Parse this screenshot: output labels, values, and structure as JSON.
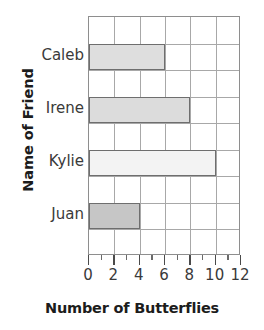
{
  "chart_data": {
    "type": "bar",
    "orientation": "horizontal",
    "title": "",
    "xlabel": "Number of Butterflies",
    "ylabel": "Name of Friend",
    "categories": [
      "Caleb",
      "Irene",
      "Kylie",
      "Juan"
    ],
    "values": [
      6,
      8,
      10,
      4
    ],
    "bar_colors": [
      "#dedede",
      "#dcdcdc",
      "#f3f3f3",
      "#c6c6c6"
    ],
    "bar_border_color": "#6e6e6e",
    "xlim": [
      0,
      12
    ],
    "xticks": [
      0,
      2,
      4,
      6,
      8,
      10,
      12
    ],
    "xtick_labels": [
      "0",
      "2",
      "4",
      "6",
      "8",
      "10",
      "12"
    ],
    "x_minor_tick_step": 1,
    "grid": true,
    "grid_color": "#a8a8a8",
    "axis_color": "#8e8e8e",
    "legend": null,
    "legend_position": "none",
    "plot_rows": 9,
    "bar_row_indices": [
      1,
      3,
      5,
      7
    ]
  },
  "axes": {
    "x_title": "Number of Butterflies",
    "y_title": "Name of Friend"
  }
}
